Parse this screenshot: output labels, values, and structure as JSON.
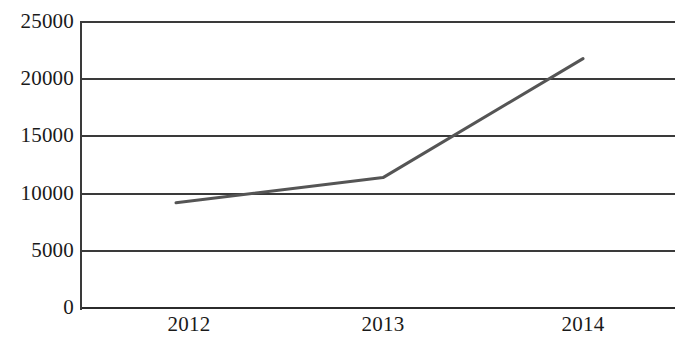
{
  "chart_data": {
    "type": "line",
    "title": "",
    "subtitle": "",
    "xlabel": "",
    "ylabel": "",
    "categories": [
      "2012",
      "2013",
      "2014"
    ],
    "x": [
      2012,
      2013,
      2014
    ],
    "series": [
      {
        "name": "",
        "values": [
          9200,
          11400,
          21800
        ],
        "color": "#555555",
        "line_width": 3,
        "markers": false
      }
    ],
    "ylim": [
      0,
      25000
    ],
    "y_ticks": [
      0,
      5000,
      10000,
      15000,
      20000,
      25000
    ],
    "y_tick_labels": [
      "0",
      "5000",
      "10000",
      "15000",
      "20000",
      "25000"
    ],
    "x_tick_labels": [
      "2012",
      "2013",
      "2014"
    ],
    "grid": {
      "horizontal": true,
      "vertical": false,
      "color": "#3a3a3a"
    },
    "legend": {
      "visible": false,
      "position": "none",
      "entries": []
    },
    "axes": {
      "y_axis_visible": true,
      "x_axis_visible": true,
      "right_spine_visible": false,
      "top_gridline_visible": true,
      "axis_color": "#3a3a3a"
    },
    "annotations": []
  },
  "layout": {
    "plot_left_px": 80,
    "plot_top_px": 22,
    "plot_width_px": 595,
    "plot_height_px": 286,
    "point_x_px": [
      176,
      383,
      583
    ],
    "point_y_px": [
      208,
      178,
      57
    ],
    "y_gridline_y_px": [
      22,
      80,
      137,
      194,
      251,
      308
    ],
    "x_label_center_px": [
      189,
      383,
      583
    ],
    "background": "#ffffff"
  }
}
